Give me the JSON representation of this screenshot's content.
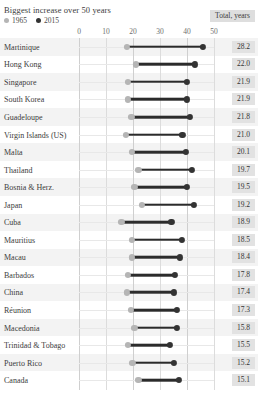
{
  "header": {
    "title": "Biggest increase over 50 years",
    "total_badge": "Total, years"
  },
  "legend": [
    {
      "label": "1965",
      "color": "#b5b5b5",
      "icon": "circle-icon"
    },
    {
      "label": "2015",
      "color": "#333333",
      "icon": "circle-icon"
    }
  ],
  "chart_data": {
    "type": "bar",
    "subtype": "dumbbell",
    "title": "Biggest increase over 50 years",
    "xlabel": "",
    "ylabel": "",
    "xlim": [
      0,
      50
    ],
    "grid": true,
    "legend_position": "top-left",
    "tick_labels": [
      "0",
      "10",
      "20",
      "30",
      "40",
      "50"
    ],
    "ticks": [
      0,
      10,
      20,
      30,
      40,
      50
    ],
    "value_column_header": "Total, years",
    "categories": [
      "Martinique",
      "Hong Kong",
      "Singapore",
      "South Korea",
      "Guadeloupe",
      "Virgin Islands (US)",
      "Malta",
      "Thailand",
      "Bosnia & Herz.",
      "Japan",
      "Cuba",
      "Mauritius",
      "Macau",
      "Barbados",
      "China",
      "Réunion",
      "Macedonia",
      "Trinidad & Tobago",
      "Puerto Rico",
      "Canada"
    ],
    "series": [
      {
        "name": "1965",
        "color": "#b5b5b5",
        "values": [
          17.8,
          21.0,
          18.2,
          18.2,
          19.4,
          17.3,
          19.5,
          22.0,
          20.5,
          23.3,
          15.7,
          19.7,
          19.5,
          18.0,
          17.8,
          19.1,
          20.5,
          18.1,
          19.8,
          22.0
        ]
      },
      {
        "name": "2015",
        "color": "#333333",
        "values": [
          46.0,
          43.0,
          40.1,
          40.1,
          41.2,
          38.3,
          39.6,
          41.7,
          40.0,
          42.5,
          34.2,
          38.1,
          37.3,
          35.4,
          35.2,
          36.4,
          36.3,
          33.6,
          35.0,
          37.1
        ]
      }
    ],
    "totals": [
      28.2,
      22.0,
      21.9,
      21.9,
      21.8,
      21.0,
      20.1,
      19.7,
      19.5,
      19.2,
      18.9,
      18.5,
      18.4,
      17.8,
      17.4,
      17.3,
      15.8,
      15.5,
      15.2,
      15.1
    ]
  }
}
